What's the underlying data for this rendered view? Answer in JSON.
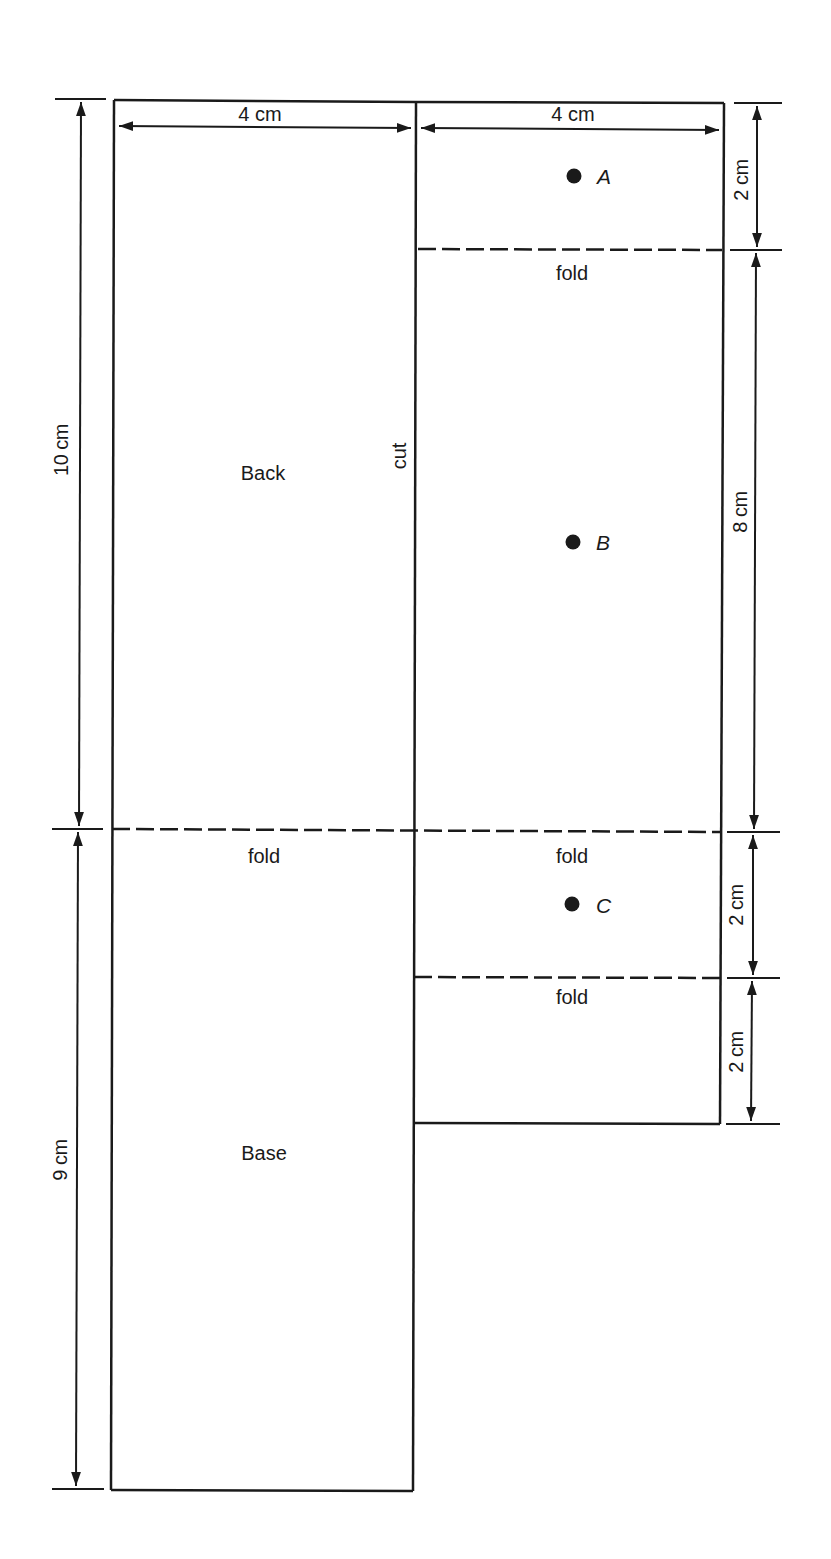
{
  "diagram": {
    "panels": {
      "back": {
        "label": "Back"
      },
      "base": {
        "label": "Base"
      }
    },
    "annotations": {
      "cut": "cut",
      "fold_back_base": "fold",
      "fold_right_top": "fold",
      "fold_right_middle": "fold",
      "fold_right_bottom": "fold"
    },
    "dimensions": {
      "left_width": "4 cm",
      "right_width": "4 cm",
      "back_height": "10 cm",
      "base_height": "9 cm",
      "right_top": "2 cm",
      "right_middle": "8 cm",
      "right_lower1": "2 cm",
      "right_lower2": "2 cm"
    },
    "points": [
      {
        "name": "A"
      },
      {
        "name": "B"
      },
      {
        "name": "C"
      }
    ]
  }
}
